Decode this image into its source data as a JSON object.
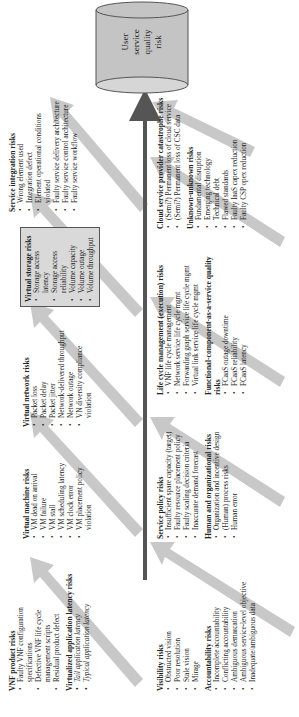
{
  "diagram": {
    "target": {
      "label_lines": [
        "User",
        "service",
        "quality",
        "risk"
      ]
    },
    "colors": {
      "main_arrow": "#555555",
      "fat_arrow": "#c8c8c8",
      "cylinder": "#c4c4c4",
      "box_fill": "#d9d9d9"
    },
    "top_row": [
      {
        "title": "VNF product risks",
        "items": [
          "Faulty VNF configuration specifications",
          "Defective VNF life cycle management scripts",
          "Residual product defect"
        ],
        "title2": "Virtualized application latency risks",
        "items2": [
          "Tail application latency",
          "Typical application latency"
        ]
      },
      {
        "title": "Virtual machine risks",
        "items": [
          "VM dead on arrival",
          "VM failure",
          "VM stall",
          "VM scheduling latency",
          "VM clock error",
          "VM placement policy violation"
        ]
      },
      {
        "title": "Virtual network risks",
        "items": [
          "Packet loss",
          "Packet delay",
          "Packet jitter",
          "Network-delivered throughput",
          "Network outage",
          "VN diversity compliance violation"
        ]
      },
      {
        "title": "Virtual storage risks",
        "items": [
          "Storage access latency",
          "Storage access reliability",
          "Volume capacity",
          "Volume outage",
          "Volume throughput"
        ]
      },
      {
        "title": "Service integration risks",
        "items": [
          "Wrong element used",
          "Integration defect",
          "Element operational conditions violated",
          "Faulty service delivery architecture",
          "Faulty service control architecture",
          "Faulty service workflow"
        ]
      }
    ],
    "bottom_row": [
      {
        "title": "Visibility risks",
        "items": [
          "Obstructed vision",
          "Poor resolution",
          "Stale vision",
          "Mirage"
        ],
        "title2": "Accountability risks",
        "items2": [
          "Incomplete accountability",
          "Conflicting accountability",
          "Ambiguous demarcation",
          "Ambiguous service-level objective",
          "Inadequate/ambiguous data"
        ]
      },
      {
        "title": "Service policy risks",
        "items": [
          "Insufficient spare capacity (target)",
          "Faulty resource placement policy",
          "Faulty scaling decision criteria",
          "Inaccurate demand forecast"
        ],
        "title2": "Human and organizational risks",
        "items2": [
          "Organization and incentive design",
          "(Human) process risks",
          "Human error"
        ]
      },
      {
        "title": "Life cycle management (execution) risks",
        "items": [
          "VNF life cycle management",
          "Network service life cycle mgmt",
          "Forwarding graph service life cycle mgmt",
          "Virtual link service life cycle mgmt"
        ],
        "title2": "Functional-component-as-a-service quality risks",
        "items2": [
          "FCaaS outage downtime",
          "FCaaS reliability",
          "FCaaS latency"
        ]
      },
      {
        "title": "Cloud service provider catastrophe risks",
        "items": [
          "(Semi?) Permanent loss of cloud service",
          "(Semi?) Permanent loss of CSC data"
        ],
        "title2": "Unknown-unknown risks",
        "items2": [
          "Fundamental disruption",
          "Emerging technology",
          "Technical debt",
          "Flawed standards",
          "Faulty IaaS capex reduction",
          "Faulty CSP opex reduction"
        ]
      }
    ]
  }
}
